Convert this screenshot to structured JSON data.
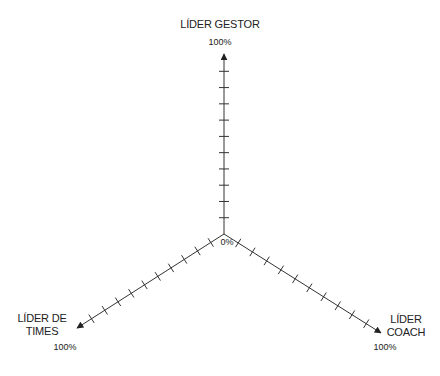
{
  "diagram": {
    "type": "triangular-axes",
    "origin_label": "0%",
    "ticks_per_axis": 10,
    "axes": [
      {
        "id": "gestor",
        "name": "LÍDER GESTOR",
        "name_lines": [
          "LÍDER GESTOR"
        ],
        "max_label": "100%",
        "direction": "up"
      },
      {
        "id": "times",
        "name": "LÍDER DE TIMES",
        "name_lines": [
          "LÍDER DE",
          "TIMES"
        ],
        "max_label": "100%",
        "direction": "down-left"
      },
      {
        "id": "coach",
        "name": "LÍDER COACH",
        "name_lines": [
          "LÍDER",
          "COACH"
        ],
        "max_label": "100%",
        "direction": "down-right"
      }
    ],
    "colors": {
      "line": "#333333",
      "text": "#222222",
      "background": "#ffffff"
    }
  }
}
